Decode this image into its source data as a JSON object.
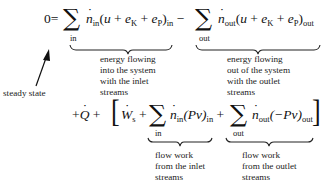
{
  "equation": {
    "line1": {
      "lhs": "0",
      "equals": "=",
      "sum1_limit": "in",
      "term1": {
        "coef": "n",
        "coef_sub": "in",
        "open": "(",
        "u": "u",
        "plus1": "+",
        "eK": "e",
        "eK_sub": "K",
        "plus2": "+",
        "eP": "e",
        "eP_sub": "P",
        "close": ")",
        "close_sub": "in"
      },
      "minus": "−",
      "sum2_limit": "out",
      "term2": {
        "coef": "n",
        "coef_sub": "out",
        "open": "(",
        "u": "u",
        "plus1": "+",
        "eK": "e",
        "eK_sub": "K",
        "plus2": "+",
        "eP": "e",
        "eP_sub": "P",
        "close": ")",
        "close_sub": "out"
      }
    },
    "line2": {
      "plus_q": "+",
      "Q": "Q",
      "plus_b": "+",
      "lbracket": "[",
      "W": "W",
      "W_sub": "s",
      "plus_w": "+",
      "sum3_limit": "in",
      "term3": {
        "coef": "n",
        "coef_sub": "in",
        "expr": "(Pv)",
        "expr_sub": "in"
      },
      "plus_4": "+",
      "sum4_limit": "out",
      "term4": {
        "coef": "n",
        "coef_sub": "out",
        "expr": "(−Pv)",
        "expr_sub": "out"
      },
      "rbracket": "]"
    },
    "sigma": "∑"
  },
  "annotations": {
    "steady_state": "steady state",
    "energy_in": [
      "energy flowing",
      "into the system",
      "with the inlet",
      "streams"
    ],
    "energy_out": [
      "energy flowing",
      "out of the system",
      "with the outlet",
      "streams"
    ],
    "flow_work_in": [
      "flow work",
      "from the inlet",
      "streams"
    ],
    "flow_work_out": [
      "flow work",
      "from the outlet",
      "streams"
    ]
  }
}
